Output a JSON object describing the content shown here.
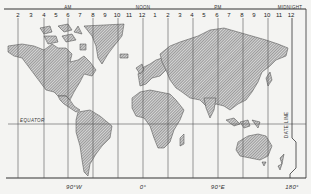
{
  "map": {
    "title": "World time zones map",
    "period_labels": {
      "am": "AM",
      "noon": "NOON",
      "pm": "PM",
      "midnight": "MIDNIGHT"
    },
    "hour_labels": [
      "2",
      "3",
      "4",
      "5",
      "6",
      "7",
      "8",
      "9",
      "10",
      "11",
      "12",
      "1",
      "2",
      "3",
      "4",
      "5",
      "6",
      "7",
      "8",
      "9",
      "10",
      "11",
      "12"
    ],
    "equator_label": "EQUATOR",
    "date_line_label": "DATE LINE",
    "longitude_labels": [
      "90°W",
      "0°",
      "90°E",
      "180°"
    ],
    "colors": {
      "background": "#f4f4f2",
      "land_hatch": "#555555",
      "lines": "#444444"
    }
  }
}
